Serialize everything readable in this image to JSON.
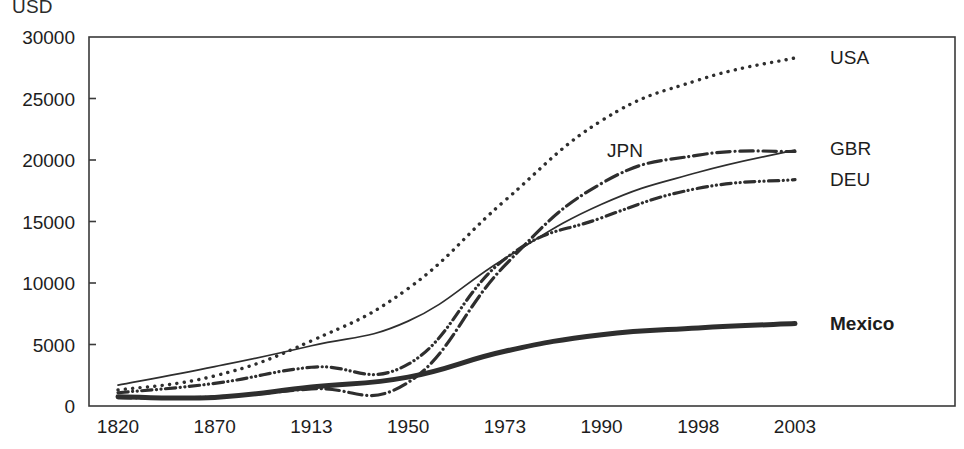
{
  "axis_unit_label": "USD",
  "chart_data": {
    "type": "line",
    "title": "",
    "subtitle": "",
    "xlabel": "",
    "ylabel": "USD",
    "categories": [
      "1820",
      "1870",
      "1913",
      "1950",
      "1973",
      "1990",
      "1998",
      "2003"
    ],
    "x_tick_labels": [
      "1820",
      "1870",
      "1913",
      "1950",
      "1973",
      "1990",
      "1998",
      "2003"
    ],
    "y_tick_labels": [
      "0",
      "5000",
      "10000",
      "15000",
      "20000",
      "25000",
      "30000"
    ],
    "y_ticks": [
      0,
      5000,
      10000,
      15000,
      20000,
      25000,
      30000
    ],
    "ylim": [
      0,
      30000
    ],
    "grid": false,
    "legend_position": "inline-right",
    "series": [
      {
        "name": "USA",
        "label": "USA",
        "style": "dotted",
        "color": "#2e2e2e",
        "width": 3.4,
        "values": [
          1300,
          2450,
          5300,
          9550,
          16700,
          23200,
          26500,
          28300
        ]
      },
      {
        "name": "GBR",
        "label": "GBR",
        "style": "solid",
        "color": "#2e2e2e",
        "width": 1.7,
        "values": [
          1700,
          3200,
          4900,
          6900,
          12000,
          16400,
          19000,
          20800
        ]
      },
      {
        "name": "JPN",
        "label": "JPN",
        "style": "dash-dot",
        "color": "#2e2e2e",
        "width": 3.2,
        "values": [
          670,
          740,
          1390,
          1920,
          11430,
          18100,
          20400,
          20700
        ]
      },
      {
        "name": "DEU",
        "label": "DEU",
        "style": "dash-dot-dot",
        "color": "#2e2e2e",
        "width": 3.2,
        "values": [
          1080,
          1840,
          3150,
          3400,
          11950,
          15300,
          17700,
          18400
        ]
      },
      {
        "name": "Mexico",
        "label": "Mexico",
        "style": "solid-bold",
        "color": "#2e2e2e",
        "width": 5.0,
        "values": [
          760,
          700,
          1550,
          2350,
          4450,
          5800,
          6350,
          6700
        ]
      }
    ],
    "annotations": [
      {
        "text": "JPN",
        "series": "JPN",
        "placement": "inside-plot"
      },
      {
        "text": "USA",
        "series": "USA",
        "placement": "right-of-line"
      },
      {
        "text": "GBR",
        "series": "GBR",
        "placement": "right-of-line"
      },
      {
        "text": "DEU",
        "series": "DEU",
        "placement": "right-of-line"
      },
      {
        "text": "Mexico",
        "series": "Mexico",
        "placement": "right-of-line"
      }
    ]
  }
}
